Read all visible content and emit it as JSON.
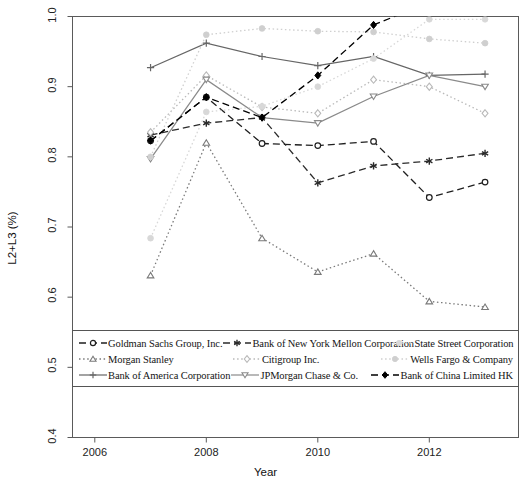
{
  "chart_data": {
    "type": "line",
    "title": "",
    "xlabel": "Year",
    "ylabel": "L2+L3 (%)",
    "xlim": [
      2005.6,
      2013.6
    ],
    "ylim": [
      0.4,
      1.0
    ],
    "xticks": [
      2006,
      2008,
      2010,
      2012
    ],
    "yticks": [
      0.4,
      0.5,
      0.6,
      0.7,
      0.8,
      0.9,
      1.0
    ],
    "ytick_labels": [
      "0.4",
      "0.5",
      "0.6",
      "0.7",
      "0.8",
      "0.9",
      "1.0"
    ],
    "xtick_labels": [
      "2006",
      "2008",
      "2010",
      "2012"
    ],
    "grid": false,
    "legend_position": "lower-left-inside",
    "x": [
      2007,
      2008,
      2009,
      2010,
      2011,
      2012,
      2013
    ],
    "series": [
      {
        "name": "Goldman Sachs Group, Inc.",
        "marker": "circle-open",
        "linestyle": "dashed",
        "color": "#1f1f1f",
        "values": [
          0.823,
          0.885,
          0.819,
          0.816,
          0.822,
          0.742,
          0.764
        ]
      },
      {
        "name": "Morgan Stanley",
        "marker": "triangle-open",
        "linestyle": "dotted",
        "color": "#7a7a7a",
        "values": [
          0.631,
          0.82,
          0.684,
          0.636,
          0.662,
          0.594,
          0.586
        ]
      },
      {
        "name": "Bank of America Corporation",
        "marker": "plus",
        "linestyle": "solid",
        "color": "#666666",
        "values": [
          0.927,
          0.962,
          0.943,
          0.93,
          0.943,
          0.916,
          0.918
        ]
      },
      {
        "name": "Bank of New York Mellon Corporation",
        "marker": "asterisk",
        "linestyle": "dashed",
        "color": "#2b2b2b",
        "values": [
          0.831,
          0.848,
          0.856,
          0.763,
          0.787,
          0.794,
          0.805
        ]
      },
      {
        "name": "Citigroup Inc.",
        "marker": "diamond-open",
        "linestyle": "dotted",
        "color": "#b9b9b9",
        "values": [
          0.835,
          0.916,
          0.871,
          0.862,
          0.91,
          0.9,
          0.862
        ]
      },
      {
        "name": "JPMorgan Chase & Co.",
        "marker": "triangle-down",
        "linestyle": "solid",
        "color": "#8a8a8a",
        "values": [
          0.797,
          0.91,
          0.856,
          0.848,
          0.886,
          0.916,
          0.9
        ]
      },
      {
        "name": "State Street Corporation",
        "marker": "circle-filled",
        "linestyle": "dotted",
        "color": "#d8d8d8",
        "values": [
          0.684,
          0.864,
          0.872,
          0.9,
          0.94,
          0.996,
          0.996
        ]
      },
      {
        "name": "Wells Fargo & Company",
        "marker": "circle-filled",
        "linestyle": "dotted",
        "color": "#cfcfcf",
        "values": [
          0.8,
          0.974,
          0.983,
          0.979,
          0.978,
          0.968,
          0.962
        ]
      },
      {
        "name": "Bank of China Limited HK",
        "marker": "diamond-filled",
        "linestyle": "dashed",
        "color": "#000000",
        "values": [
          0.823,
          0.885,
          0.856,
          0.916,
          0.988,
          1.02,
          1.05
        ]
      }
    ]
  },
  "axes": {
    "x_title": "Year",
    "y_title": "L2+L3 (%)"
  },
  "legend": {
    "rows": [
      [
        {
          "label": "Goldman Sachs Group, Inc.",
          "series": 0
        },
        {
          "label": "Bank of New York Mellon Corporation",
          "series": 3
        },
        {
          "label": "State Street Corporation",
          "series": 6
        }
      ],
      [
        {
          "label": "Morgan Stanley",
          "series": 1
        },
        {
          "label": "Citigroup Inc.",
          "series": 4
        },
        {
          "label": "Wells Fargo & Company",
          "series": 7
        }
      ],
      [
        {
          "label": "Bank of America Corporation",
          "series": 2
        },
        {
          "label": "JPMorgan Chase & Co.",
          "series": 5
        },
        {
          "label": "Bank of China Limited HK",
          "series": 8
        }
      ]
    ]
  }
}
